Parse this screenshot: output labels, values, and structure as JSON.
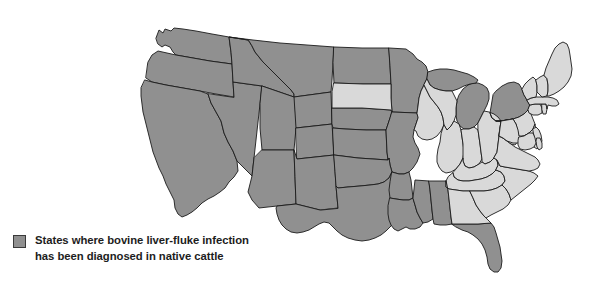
{
  "figure": {
    "type": "choropleth-map",
    "region": "United States (contiguous 48 states)",
    "background_color": "#ffffff"
  },
  "legend": {
    "swatch_color": "#909090",
    "swatch_border_color": "#3a3a3a",
    "line1": "States where bovine liver-fluke infection",
    "line2": "has been diagnosed in native cattle"
  },
  "map_data": {
    "type": "choropleth",
    "categories": [
      "shaded",
      "unshaded"
    ],
    "colors": {
      "shaded": "#909090",
      "unshaded": "#d9d9d9",
      "border": "#1b1b1b",
      "water": "#ffffff"
    },
    "shaded_meaning": "States where bovine liver-fluke infection has been diagnosed in native cattle",
    "shaded_states": [
      "WA",
      "OR",
      "CA",
      "NV",
      "ID",
      "MT",
      "WY",
      "UT",
      "AZ",
      "CO",
      "NM",
      "ND",
      "NE",
      "KS",
      "OK",
      "TX",
      "MN",
      "MO",
      "AR",
      "LA",
      "MS",
      "AL",
      "FL",
      "MI",
      "NY"
    ],
    "unshaded_states": [
      "SD",
      "IA",
      "WI",
      "IL",
      "IN",
      "OH",
      "KY",
      "TN",
      "GA",
      "SC",
      "NC",
      "VA",
      "WV",
      "PA",
      "NJ",
      "DE",
      "MD",
      "CT",
      "RI",
      "MA",
      "VT",
      "NH",
      "ME"
    ],
    "shaded_count": 25,
    "unshaded_count": 23
  }
}
